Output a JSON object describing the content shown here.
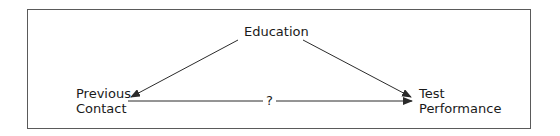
{
  "diagram": {
    "nodes": [
      {
        "id": "education",
        "label": "Education"
      },
      {
        "id": "previous_contact",
        "label_lines": [
          "Previous",
          "Contact"
        ]
      },
      {
        "id": "test_performance",
        "label_lines": [
          "Test",
          "Performance"
        ]
      }
    ],
    "edges": [
      {
        "from": "education",
        "to": "previous_contact",
        "label": ""
      },
      {
        "from": "education",
        "to": "test_performance",
        "label": ""
      },
      {
        "from": "previous_contact",
        "to": "test_performance",
        "label": "?"
      }
    ],
    "colors": {
      "line": "#2b2b2b",
      "border": "#5a5a5a",
      "background": "#ffffff"
    }
  }
}
